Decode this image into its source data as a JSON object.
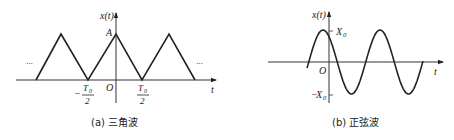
{
  "panel_a": {
    "caption": "(a) 三角波",
    "y_label": "x(t)",
    "x_label": "t",
    "origin": "O",
    "peak_label": "A",
    "left_tick": {
      "sign": "−",
      "num": "T",
      "sub": "0",
      "den": "2"
    },
    "right_tick": {
      "num": "T",
      "sub": "0",
      "den": "2"
    },
    "ellipsis_left": "···",
    "ellipsis_right": "···",
    "waveform": "triangle"
  },
  "panel_b": {
    "caption": "(b) 正弦波",
    "y_label": "x(t)",
    "x_label": "t",
    "origin": "O",
    "pos_amp": {
      "name": "X",
      "sub": "0"
    },
    "neg_amp": {
      "sign": "−",
      "name": "X",
      "sub": "0"
    },
    "waveform": "sine"
  }
}
